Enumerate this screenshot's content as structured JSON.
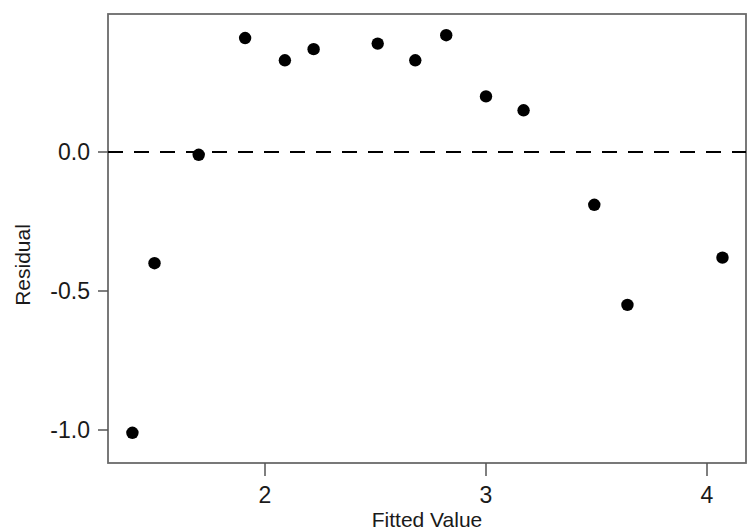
{
  "chart_data": {
    "type": "scatter",
    "title": "",
    "xlabel": "Fitted Value",
    "ylabel": "Residual",
    "xlim": [
      1.28,
      4.22
    ],
    "ylim": [
      -1.1,
      0.53
    ],
    "xticks": [
      2,
      3,
      4
    ],
    "xtick_labels": [
      "2",
      "3",
      "4"
    ],
    "yticks": [
      0.0,
      -0.5,
      -1.0
    ],
    "ytick_labels": [
      "0.0",
      "-0.5",
      "-1.0"
    ],
    "grid": false,
    "legend": "none",
    "marker": "filled-circle",
    "marker_color": "#000000",
    "reference_line": {
      "type": "horizontal",
      "y": 0.0,
      "style": "dashed",
      "color": "#000000"
    },
    "x": [
      1.4,
      1.5,
      1.7,
      1.91,
      2.09,
      2.22,
      2.51,
      2.68,
      2.82,
      3.0,
      3.17,
      3.49,
      3.64,
      4.07
    ],
    "y": [
      -1.01,
      -0.4,
      -0.01,
      0.41,
      0.33,
      0.37,
      0.39,
      0.33,
      0.42,
      0.2,
      0.15,
      -0.19,
      -0.55,
      -0.38
    ],
    "points": [
      {
        "x": 1.4,
        "y": -1.01
      },
      {
        "x": 1.5,
        "y": -0.4
      },
      {
        "x": 1.7,
        "y": -0.01
      },
      {
        "x": 1.91,
        "y": 0.41
      },
      {
        "x": 2.09,
        "y": 0.33
      },
      {
        "x": 2.22,
        "y": 0.37
      },
      {
        "x": 2.51,
        "y": 0.39
      },
      {
        "x": 2.68,
        "y": 0.33
      },
      {
        "x": 2.82,
        "y": 0.42
      },
      {
        "x": 3.0,
        "y": 0.2
      },
      {
        "x": 3.17,
        "y": 0.15
      },
      {
        "x": 3.49,
        "y": -0.19
      },
      {
        "x": 3.64,
        "y": -0.55
      },
      {
        "x": 4.07,
        "y": -0.38
      }
    ]
  },
  "axes": {
    "x_title": "Fitted Value",
    "y_title": "Residual",
    "x_tick_labels": [
      "2",
      "3",
      "4"
    ],
    "y_tick_labels": [
      "0.0",
      "-0.5",
      "-1.0"
    ]
  }
}
